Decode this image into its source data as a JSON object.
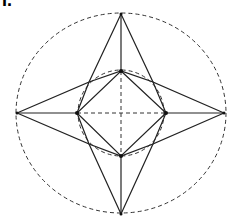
{
  "figure": {
    "label": "I.",
    "stroke_color": "#222222",
    "dash_color": "#333333"
  },
  "geometry": {
    "center": [
      121,
      113
    ],
    "outer_circle": {
      "rx": 105,
      "ry": 100,
      "style": "dashed"
    },
    "inner_circle": {
      "r": 43,
      "style": "dashed"
    },
    "outer_tips": {
      "top": [
        121,
        14
      ],
      "bottom": [
        121,
        214
      ],
      "left": [
        17,
        113
      ],
      "right": [
        224,
        113
      ]
    },
    "inner_vertices": {
      "top": [
        121,
        71
      ],
      "bottom": [
        121,
        156
      ],
      "left": [
        77,
        113
      ],
      "right": [
        166,
        113
      ]
    },
    "octagon_points": {
      "upper_left": [
        89,
        82
      ],
      "upper_right": [
        153,
        82
      ],
      "lower_left": [
        89,
        144
      ],
      "lower_right": [
        153,
        144
      ]
    }
  }
}
